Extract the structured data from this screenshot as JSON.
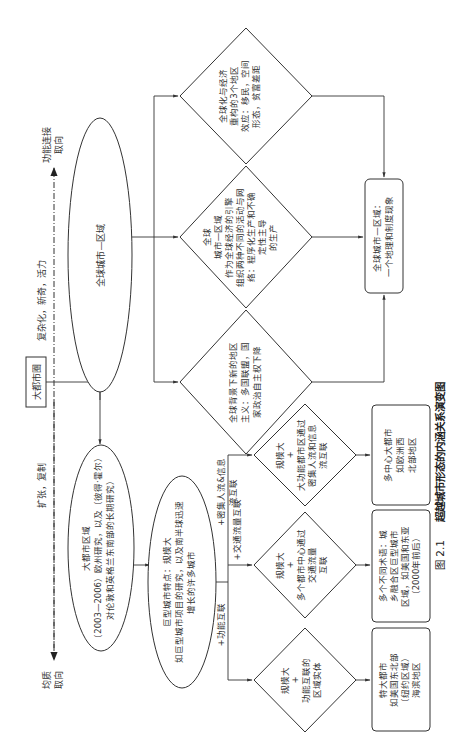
{
  "caption": {
    "number": "图 2.1",
    "title": "超越城市形态的内涵关系演变图"
  },
  "axis": {
    "top_label": [
      "功能连接",
      "取向"
    ],
    "bottom_label": [
      "均质",
      "取向"
    ],
    "upper_segment_label": "复杂化，新奇，活力",
    "lower_segment_label": "扩张，复制",
    "midpoint_box": "大都市圈"
  },
  "ellipses": [
    {
      "id": "global-city-region",
      "lines": [
        "全球城市—区域"
      ]
    },
    {
      "id": "mega-city-region",
      "lines": [
        "大都市区域",
        "（2003—2006）欧州研究，以及（彼得·霍尔）",
        "对伦敦和英格兰东南部的长期研究）"
      ]
    },
    {
      "id": "megacity",
      "lines": [
        "巨型城市特点：规模大",
        "如巨型城市项目的研究，以及南半球迅速",
        "增长的许多城市"
      ]
    }
  ],
  "large_diamonds": [
    {
      "id": "globalization-effects",
      "lines": [
        "全球化与经济",
        "重构的3个地区",
        "效应：移民，空间",
        "形态，贫富差距"
      ]
    },
    {
      "id": "economic-engine",
      "lines": [
        "全球",
        "城市—区域",
        "作为全球经济的引擎",
        "组织两种不同的活动与网",
        "络：程序化生产和不确",
        "定性主导",
        "的生产"
      ]
    },
    {
      "id": "new-regionalism",
      "lines": [
        "全球背景下新的地区",
        "主义：多国联盟，国",
        "家政治自主权下降"
      ]
    }
  ],
  "small_diamonds": [
    {
      "id": "dense-flows",
      "lines": [
        "规模大",
        "+",
        "大功能都市区通过",
        "密集人流和信息",
        "流互联"
      ]
    },
    {
      "id": "transport-flows",
      "lines": [
        "规模大",
        "+",
        "多个都市中心通过",
        "交通流量",
        "互联"
      ]
    },
    {
      "id": "functional-links",
      "lines": [
        "规模大",
        "+",
        "功能互联的",
        "区域实体"
      ]
    }
  ],
  "branch_labels": {
    "functional": "+功能互联",
    "transport": "+交通流量互联",
    "dense": [
      "+密集人流&信息",
      "流互联"
    ]
  },
  "result_boxes": [
    {
      "id": "global-region-phenomenon",
      "lines": [
        "全球城市—区域：",
        "一个地理和制度现象"
      ]
    },
    {
      "id": "polycentric",
      "lines": [
        "多中心大都市",
        "如欧洲西",
        "北部地区"
      ]
    },
    {
      "id": "multi-terms",
      "lines": [
        "多个不同术语：城",
        "乡融合区巨型城市",
        "区域，如美国和东亚",
        "（2000年前后）"
      ]
    },
    {
      "id": "megalopolis",
      "lines": [
        "特大都市",
        "如美国东北部",
        "（纽约区域）",
        "海滨地区"
      ]
    }
  ]
}
